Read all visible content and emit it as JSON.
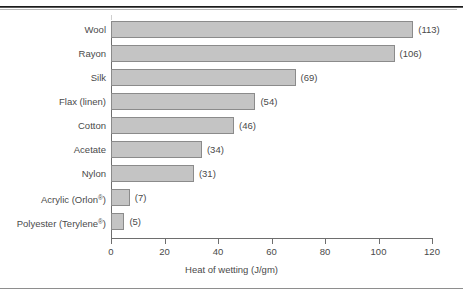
{
  "figure": {
    "rules": {
      "top_rule": "thick-dark-rule",
      "bottom_rule": "thin-gray-rule"
    }
  },
  "chart_data": {
    "type": "bar",
    "orientation": "horizontal",
    "title": "",
    "xlabel": "Heat of wetting (J/gm)",
    "ylabel": "",
    "xlim": [
      0,
      120
    ],
    "xticks": [
      0,
      20,
      40,
      60,
      80,
      100,
      120
    ],
    "grid": false,
    "legend": false,
    "bar_color": "#c4c4c4",
    "bar_edge_color": "#8b8b8b",
    "categories": [
      "Wool",
      "Rayon",
      "Silk",
      "Flax (linen)",
      "Cotton",
      "Acetate",
      "Nylon",
      "Acrylic (Orlon®)",
      "Polyester (Terylene®)"
    ],
    "values": [
      113,
      106,
      69,
      54,
      46,
      34,
      31,
      7,
      5
    ],
    "value_labels": [
      "(113)",
      "(106)",
      "(69)",
      "(54)",
      "(46)",
      "(34)",
      "(31)",
      "(7)",
      "(5)"
    ],
    "tick_labels": [
      "0",
      "20",
      "40",
      "60",
      "80",
      "100",
      "120"
    ]
  }
}
